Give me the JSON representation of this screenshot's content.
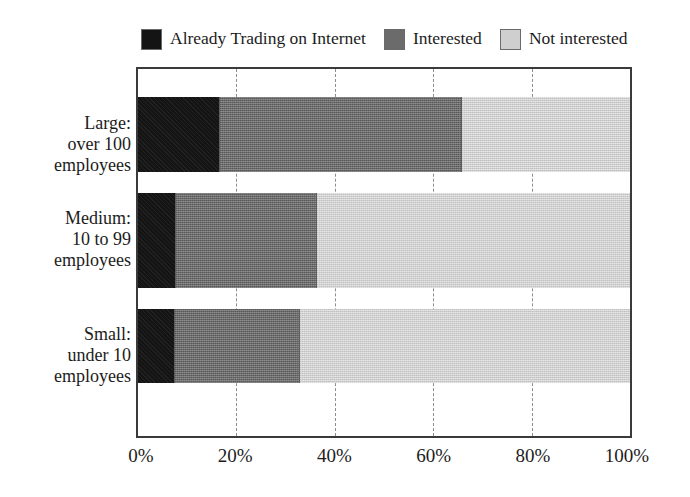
{
  "chart_data": {
    "type": "bar",
    "orientation": "horizontal",
    "stacked": true,
    "stack_mode": "percent",
    "title": "",
    "subtitle": "",
    "xlabel": "",
    "ylabel": "",
    "xlim": [
      0,
      100
    ],
    "xtick_values": [
      0,
      20,
      40,
      60,
      80,
      100
    ],
    "xtick_labels": [
      "0%",
      "20%",
      "40%",
      "60%",
      "80%",
      "100%"
    ],
    "grid": "vertical-dashed",
    "legend_position": "top-left",
    "categories": [
      "Large:\nover 100\nemployees",
      "Medium:\n10 to 99\nemployees",
      "Small:\nunder 10\nemployees"
    ],
    "category_labels": [
      {
        "line1": "Large:",
        "line2": "over 100",
        "line3": "employees"
      },
      {
        "line1": "Medium:",
        "line2": "10 to 99",
        "line3": "employees"
      },
      {
        "line1": "Small:",
        "line2": "under 10",
        "line3": "employees"
      }
    ],
    "series": [
      {
        "name": "Already Trading on Internet",
        "color": "#141414",
        "values": [
          16.6,
          7.7,
          7.6
        ]
      },
      {
        "name": "Interested",
        "color": "#6b6b6b",
        "values": [
          49.3,
          28.7,
          25.3
        ]
      },
      {
        "name": "Not interested",
        "color": "#cfcfcf",
        "values": [
          34.1,
          63.6,
          67.1
        ]
      }
    ],
    "cumulative_boundaries": [
      [
        16.6,
        65.9
      ],
      [
        7.7,
        36.4
      ],
      [
        7.6,
        32.9
      ]
    ]
  },
  "legend": {
    "entries": [
      {
        "label": "Already Trading on Internet",
        "color": "#141414"
      },
      {
        "label": "Interested",
        "color": "#6b6b6b"
      },
      {
        "label": "Not interested",
        "color": "#cfcfcf"
      }
    ]
  },
  "axis": {
    "x_ticks": [
      {
        "label": "0%",
        "value": 0
      },
      {
        "label": "20%",
        "value": 20
      },
      {
        "label": "40%",
        "value": 40
      },
      {
        "label": "60%",
        "value": 60
      },
      {
        "label": "80%",
        "value": 80
      },
      {
        "label": "100%",
        "value": 100
      }
    ]
  },
  "colors": {
    "frame": "#3a3a3a",
    "gridline": "#8d8d8d",
    "background": "#ffffff",
    "text": "#1c1c1c"
  }
}
